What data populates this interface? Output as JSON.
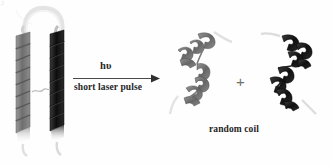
{
  "figure": {
    "type": "photochemical-reaction-scheme",
    "background_color": "#fefefe",
    "width": 332,
    "height": 164
  },
  "reactant": {
    "name": "coiled-coil-dimer",
    "description": "two parallel alpha-helices joined by a hairpin loop",
    "helix_left": {
      "name": "alpha-helix-gray",
      "color": "#7d7d7d",
      "turns": 9
    },
    "helix_right": {
      "name": "alpha-helix-dark",
      "color": "#1c1c1c",
      "turns": 9
    },
    "loop_color": "#e2e2e2"
  },
  "arrow": {
    "name": "reaction-arrow",
    "color": "#4a4a4a",
    "label_above": "hυ",
    "label_below": "short laser pulse"
  },
  "products": {
    "separator": "+",
    "separator_color": "#6f6f6f",
    "caption": "random coil",
    "items": [
      {
        "name": "random-coil-gray",
        "color": "#6e6e6e",
        "tail_color": "#dcdcdc"
      },
      {
        "name": "random-coil-dark",
        "color": "#1c1c1c",
        "tail_color": "#d8d8d8"
      }
    ]
  }
}
